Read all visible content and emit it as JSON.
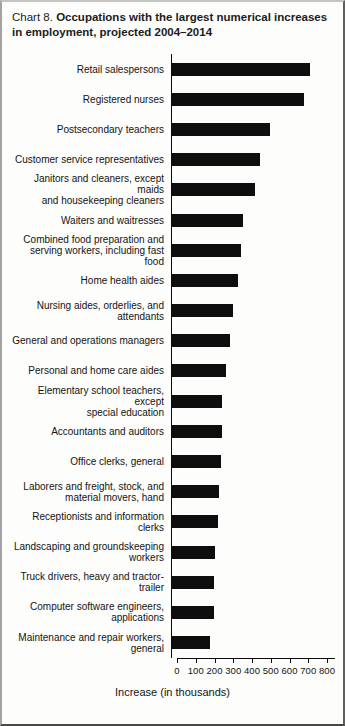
{
  "title": {
    "prefix": "Chart 8.",
    "main": "Occupations with the largest numerical increases in employment, projected 2004–2014"
  },
  "chart_data": {
    "type": "bar",
    "orientation": "horizontal",
    "title": "Chart 8. Occupations with the largest numerical increases in employment, projected 2004–2014",
    "xlabel": "Increase (in thousands)",
    "xlim": [
      0,
      800
    ],
    "x_ticks": [
      0,
      100,
      200,
      300,
      400,
      500,
      600,
      700,
      800
    ],
    "grid": false,
    "bar_color": "#0e0e0e",
    "categories": [
      "Retail salespersons",
      "Registered nurses",
      "Postsecondary teachers",
      "Customer service representatives",
      "Janitors and cleaners, except maids\nand housekeeping cleaners",
      "Waiters and waitresses",
      "Combined food preparation and\nserving workers, including fast food",
      "Home health aides",
      "Nursing aides, orderlies, and\nattendants",
      "General and operations managers",
      "Personal and home care aides",
      "Elementary school teachers, except\nspecial education",
      "Accountants and auditors",
      "Office clerks, general",
      "Laborers and freight, stock, and\nmaterial movers, hand",
      "Receptionists and information clerks",
      "Landscaping and groundskeeping\nworkers",
      "Truck drivers, heavy and tractor-trailer",
      "Computer software engineers,\napplications",
      "Maintenance and repair workers,\ngeneral"
    ],
    "values": [
      736,
      703,
      524,
      471,
      440,
      376,
      367,
      350,
      325,
      308,
      287,
      265,
      264,
      263,
      248,
      246,
      230,
      223,
      222,
      202
    ]
  }
}
